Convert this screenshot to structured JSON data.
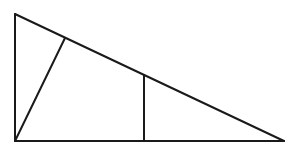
{
  "canvas": {
    "width": 301,
    "height": 150,
    "background": "#ffffff"
  },
  "style": {
    "stroke_color": "#1a1a1a",
    "stroke_width": 2
  },
  "figure": {
    "type": "right-triangle-with-cevians",
    "vertices": {
      "top_left": {
        "x": 15,
        "y": 14
      },
      "bottom_left": {
        "x": 15,
        "y": 141
      },
      "bottom_right": {
        "x": 284,
        "y": 141
      }
    },
    "points_on_hypotenuse": {
      "slant_foot": {
        "x": 65,
        "y": 38
      },
      "vertical_top": {
        "x": 144,
        "y": 75
      }
    },
    "points_on_base": {
      "vertical_foot": {
        "x": 144,
        "y": 141
      }
    },
    "segments": [
      {
        "name": "left-leg",
        "from": "top_left",
        "to": "bottom_left"
      },
      {
        "name": "base",
        "from": "bottom_left",
        "to": "bottom_right"
      },
      {
        "name": "hypotenuse",
        "from": "top_left",
        "to": "bottom_right"
      },
      {
        "name": "slant-segment",
        "from": "bottom_left",
        "to": "slant_foot"
      },
      {
        "name": "vertical-segment",
        "from": "vertical_top",
        "to": "vertical_foot"
      }
    ],
    "labels": []
  }
}
